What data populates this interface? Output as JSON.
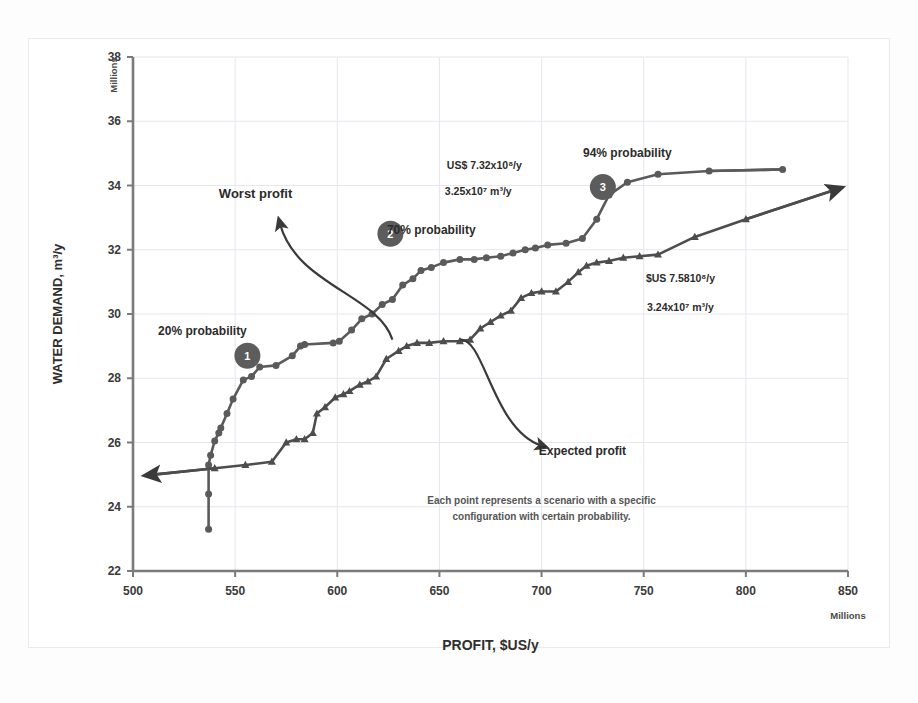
{
  "chart_data": {
    "type": "scatter",
    "title": "",
    "xlabel": "PROFIT, $US/y",
    "ylabel": "WATER DEMAND, m³/y",
    "x_unit": "Millions",
    "y_unit": "Millions",
    "xlim": [
      500,
      850
    ],
    "ylim": [
      22,
      38
    ],
    "xticks": [
      500,
      550,
      600,
      650,
      700,
      750,
      800,
      850
    ],
    "yticks": [
      22,
      24,
      26,
      28,
      30,
      32,
      34,
      36,
      38
    ],
    "grid": true,
    "legend": "none",
    "series": [
      {
        "name": "Worst profit",
        "marker": "circle",
        "color": "#5a5a5a",
        "points": [
          [
            537.0,
            23.3
          ],
          [
            537.0,
            24.4
          ],
          [
            537.0,
            25.3
          ],
          [
            538.0,
            25.6
          ],
          [
            540.0,
            26.05
          ],
          [
            542.0,
            26.3
          ],
          [
            543.0,
            26.45
          ],
          [
            546.0,
            26.9
          ],
          [
            549.0,
            27.35
          ],
          [
            554.0,
            27.95
          ],
          [
            558.0,
            28.05
          ],
          [
            562.0,
            28.35
          ],
          [
            570.0,
            28.4
          ],
          [
            578.0,
            28.7
          ],
          [
            582.0,
            29.0
          ],
          [
            584.0,
            29.05
          ],
          [
            598.0,
            29.1
          ],
          [
            601.0,
            29.15
          ],
          [
            607.0,
            29.5
          ],
          [
            612.0,
            29.85
          ],
          [
            617.0,
            30.0
          ],
          [
            622.0,
            30.3
          ],
          [
            627.0,
            30.45
          ],
          [
            632.0,
            30.9
          ],
          [
            637.0,
            31.1
          ],
          [
            641.0,
            31.35
          ],
          [
            646.0,
            31.45
          ],
          [
            652.0,
            31.6
          ],
          [
            660.0,
            31.7
          ],
          [
            667.0,
            31.7
          ],
          [
            673.0,
            31.75
          ],
          [
            680.0,
            31.8
          ],
          [
            686.0,
            31.9
          ],
          [
            692.0,
            32.0
          ],
          [
            697.0,
            32.05
          ],
          [
            703.0,
            32.15
          ],
          [
            712.0,
            32.2
          ],
          [
            720.0,
            32.35
          ],
          [
            727.0,
            32.95
          ],
          [
            733.0,
            33.7
          ],
          [
            742.0,
            34.1
          ],
          [
            757.0,
            34.35
          ],
          [
            782.0,
            34.45
          ],
          [
            818.0,
            34.5
          ]
        ]
      },
      {
        "name": "Expected profit",
        "marker": "triangle",
        "color": "#4d4d4d",
        "points": [
          [
            510.0,
            25.0
          ],
          [
            540.0,
            25.2
          ],
          [
            555.0,
            25.3
          ],
          [
            568.0,
            25.4
          ],
          [
            575.0,
            26.0
          ],
          [
            580.0,
            26.1
          ],
          [
            584.0,
            26.1
          ],
          [
            588.0,
            26.3
          ],
          [
            590.0,
            26.9
          ],
          [
            594.0,
            27.1
          ],
          [
            599.0,
            27.4
          ],
          [
            603.0,
            27.5
          ],
          [
            606.0,
            27.6
          ],
          [
            611.0,
            27.8
          ],
          [
            615.0,
            27.9
          ],
          [
            619.0,
            28.05
          ],
          [
            624.0,
            28.6
          ],
          [
            630.0,
            28.85
          ],
          [
            634.0,
            29.0
          ],
          [
            639.0,
            29.1
          ],
          [
            645.0,
            29.1
          ],
          [
            652.0,
            29.15
          ],
          [
            660.0,
            29.15
          ],
          [
            665.0,
            29.2
          ],
          [
            670.0,
            29.55
          ],
          [
            675.0,
            29.75
          ],
          [
            680.0,
            29.95
          ],
          [
            685.0,
            30.1
          ],
          [
            690.0,
            30.5
          ],
          [
            695.0,
            30.65
          ],
          [
            700.0,
            30.7
          ],
          [
            707.0,
            30.7
          ],
          [
            713.0,
            31.0
          ],
          [
            718.0,
            31.3
          ],
          [
            722.0,
            31.5
          ],
          [
            727.0,
            31.6
          ],
          [
            733.0,
            31.65
          ],
          [
            740.0,
            31.75
          ],
          [
            748.0,
            31.8
          ],
          [
            757.0,
            31.85
          ],
          [
            775.0,
            32.4
          ],
          [
            800.0,
            32.95
          ],
          [
            843.0,
            33.85
          ]
        ]
      }
    ],
    "annotations": [
      {
        "id": "worst-profit-label",
        "text": "Worst profit",
        "x": 560,
        "y": 33.6
      },
      {
        "id": "expected-profit-label",
        "text": "Expected profit",
        "x": 720,
        "y": 25.6
      },
      {
        "id": "prob-20-label",
        "text": "20% probability",
        "x": 534,
        "y": 29.35
      },
      {
        "id": "prob-70-label",
        "text": "70% probability",
        "x": 646,
        "y": 32.5
      },
      {
        "id": "prob-94-label",
        "text": "94% probability",
        "x": 742,
        "y": 34.9
      },
      {
        "id": "value-profit-top",
        "text": "US$ 7.32x10⁸/y",
        "x": 672,
        "y": 34.5
      },
      {
        "id": "value-demand-top",
        "text": "3.25x10⁷ m³/y",
        "x": 669,
        "y": 33.7
      },
      {
        "id": "value-profit-bottom",
        "text": "$US 7.5810⁸/y",
        "x": 768,
        "y": 31.0
      },
      {
        "id": "value-demand-bottom",
        "text": "3.24x10⁷ m³/y",
        "x": 768,
        "y": 30.1
      },
      {
        "id": "footnote-line-1",
        "text": "Each point represents a scenario with a specific",
        "x": 700,
        "y": 24.1
      },
      {
        "id": "footnote-line-2",
        "text": "configuration with certain probability.",
        "x": 700,
        "y": 23.6
      }
    ],
    "badges": [
      {
        "label": "1",
        "x": 556.0,
        "y": 28.7
      },
      {
        "label": "2",
        "x": 626.0,
        "y": 32.5
      },
      {
        "label": "3",
        "x": 730.0,
        "y": 33.95
      }
    ]
  },
  "style": {
    "series_circle_color": "#5a5a5a",
    "series_triangle_color": "#4d4d4d",
    "badge_color": "#5c5c5c",
    "axis_color": "#7b7b7b",
    "grid_color": "#e6e6ee",
    "text_color": "#2b2b2b",
    "background": "#ffffff"
  }
}
